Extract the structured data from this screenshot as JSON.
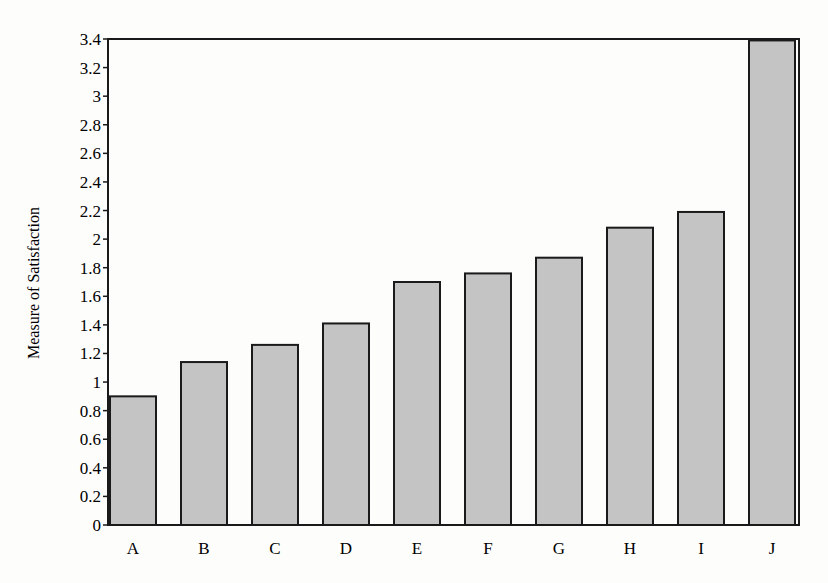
{
  "chart_data": {
    "type": "bar",
    "title": "",
    "xlabel": "",
    "ylabel": "Measure of Satisfaction",
    "categories": [
      "A",
      "B",
      "C",
      "D",
      "E",
      "F",
      "G",
      "H",
      "I",
      "J"
    ],
    "values": [
      0.9,
      1.14,
      1.26,
      1.41,
      1.7,
      1.76,
      1.87,
      2.08,
      2.19,
      3.39
    ],
    "ylim": [
      0,
      3.4
    ],
    "yticks": [
      "0",
      "0.2",
      "0.4",
      "0.6",
      "0.8",
      "1",
      "1.2",
      "1.4",
      "1.6",
      "1.8",
      "2",
      "2.2",
      "2.4",
      "2.6",
      "2.8",
      "3",
      "3.2",
      "3.4"
    ],
    "grid": false,
    "legend": null,
    "colors": {
      "bar_fill": "#c4c4c4",
      "bar_stroke": "#1a1a1a",
      "axis": "#1a1a1a",
      "background": "#fdfdfc"
    }
  }
}
